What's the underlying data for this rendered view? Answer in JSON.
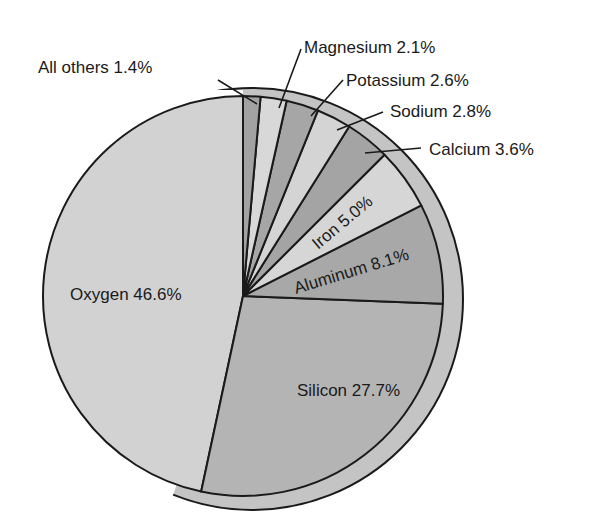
{
  "chart_data": {
    "type": "pie",
    "title": "",
    "start_angle_deg": 90,
    "direction": "clockwise_from_top_for_small, oxygen_counterclockwise",
    "slices": [
      {
        "name": "Oxygen",
        "value": 46.6,
        "label": "Oxygen 46.6%",
        "color": "#d2d2d2",
        "label_pos": "inside"
      },
      {
        "name": "Silicon",
        "value": 27.7,
        "label": "Silicon 27.7%",
        "color": "#b4b4b4",
        "label_pos": "inside"
      },
      {
        "name": "Aluminum",
        "value": 8.1,
        "label": "Aluminum 8.1%",
        "color": "#a8a8a8",
        "label_pos": "inside"
      },
      {
        "name": "Iron",
        "value": 5.0,
        "label": "Iron 5.0%",
        "color": "#d6d6d6",
        "label_pos": "inside"
      },
      {
        "name": "Calcium",
        "value": 3.6,
        "label": "Calcium 3.6%",
        "color": "#a4a4a4",
        "label_pos": "outside"
      },
      {
        "name": "Sodium",
        "value": 2.8,
        "label": "Sodium 2.8%",
        "color": "#d4d4d4",
        "label_pos": "outside"
      },
      {
        "name": "Potassium",
        "value": 2.6,
        "label": "Potassium 2.6%",
        "color": "#a6a6a6",
        "label_pos": "outside"
      },
      {
        "name": "Magnesium",
        "value": 2.1,
        "label": "Magnesium 2.1%",
        "color": "#d8d8d8",
        "label_pos": "outside"
      },
      {
        "name": "All others",
        "value": 1.4,
        "label": "All others 1.4%",
        "color": "#a2a2a2",
        "label_pos": "outside"
      }
    ],
    "legend": "none",
    "grid": false
  },
  "style": {
    "rim_color": "#c4c4c4",
    "outline_color": "#1a1a1a",
    "background": "#ffffff"
  }
}
